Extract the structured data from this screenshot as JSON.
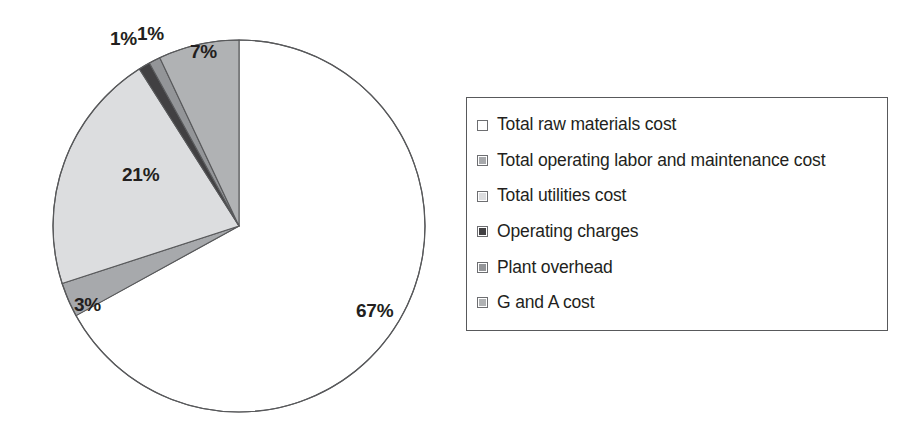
{
  "chart_data": {
    "type": "pie",
    "title": "",
    "subtitle": "",
    "xlabel": "",
    "ylabel": "",
    "grid": false,
    "legend_position": "right",
    "start_angle_deg": 0,
    "direction": "clockwise",
    "categories": [
      "Total raw materials cost",
      "Total operating labor and maintenance cost",
      "Total utilities cost",
      "Operating charges",
      "Plant overhead",
      "G and A cost"
    ],
    "values": [
      67,
      3,
      21,
      1,
      1,
      7
    ],
    "data_labels": [
      "67%",
      "3%",
      "21%",
      "1%",
      "1%",
      "7%"
    ],
    "colors": [
      "#ffffff",
      "#a7a9ac",
      "#dcdddf",
      "#414042",
      "#939598",
      "#b0b2b4"
    ],
    "slice_outline_color": "#58595b",
    "units": "percent"
  },
  "chart": {
    "slice_labels": [
      {
        "text": "67%",
        "left": 356,
        "top": 300
      },
      {
        "text": "3%",
        "left": 74,
        "top": 294
      },
      {
        "text": "21%",
        "left": 122,
        "top": 164
      },
      {
        "text": "1%",
        "left": 110,
        "top": 28
      },
      {
        "text": "1%",
        "left": 137,
        "top": 23
      },
      {
        "text": "7%",
        "left": 190,
        "top": 41
      }
    ],
    "geometry": {
      "center_x": 239,
      "center_y": 226,
      "radius": 186
    }
  },
  "legend": {
    "border_color": "#58595b",
    "items": [
      {
        "label": "Total raw materials cost",
        "swatch": "#ffffff",
        "swatch_name": "legend-swatch-total-raw-materials-cost"
      },
      {
        "label": "Total operating labor and maintenance cost",
        "swatch": "#a7a9ac",
        "swatch_name": "legend-swatch-total-operating-labor-and-maintenance-cost"
      },
      {
        "label": "Total utilities cost",
        "swatch": "#dcdddf",
        "swatch_name": "legend-swatch-total-utilities-cost"
      },
      {
        "label": "Operating charges",
        "swatch": "#414042",
        "swatch_name": "legend-swatch-operating-charges"
      },
      {
        "label": "Plant overhead",
        "swatch": "#939598",
        "swatch_name": "legend-swatch-plant-overhead"
      },
      {
        "label": "G and A cost",
        "swatch": "#b0b2b4",
        "swatch_name": "legend-swatch-g-and-a-cost"
      }
    ]
  }
}
